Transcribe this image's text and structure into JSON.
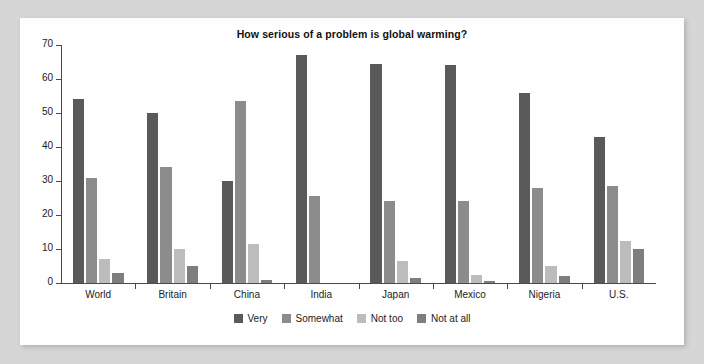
{
  "chart_data": {
    "type": "bar",
    "title": "How serious of a problem is global warming?",
    "xlabel": "",
    "ylabel": "",
    "ylim": [
      0,
      70
    ],
    "yticks": [
      0,
      10,
      20,
      30,
      40,
      50,
      60,
      70
    ],
    "grid": false,
    "legend_position": "bottom",
    "categories": [
      "World",
      "Britain",
      "China",
      "India",
      "Japan",
      "Mexico",
      "Nigeria",
      "U.S."
    ],
    "series": [
      {
        "name": "Very",
        "color": "#5a5a5a",
        "values": [
          54,
          50,
          30,
          67,
          64.5,
          64,
          56,
          43
        ]
      },
      {
        "name": "Somewhat",
        "color": "#8c8c8c",
        "values": [
          31,
          34,
          53.5,
          25.5,
          24,
          24,
          28,
          28.5
        ]
      },
      {
        "name": "Not too",
        "color": "#bcbcbc",
        "values": [
          7,
          10,
          11.5,
          0,
          6.5,
          2.5,
          5,
          12.5
        ]
      },
      {
        "name": "Not at all",
        "color": "#7e7e7e",
        "values": [
          3,
          5,
          1,
          0,
          1.5,
          0.5,
          2,
          10
        ]
      }
    ]
  },
  "colors": {
    "page_background": "#d6d6d6",
    "panel_background": "#fefefe",
    "axis": "#4a4a4a",
    "text": "#1c1c1c"
  }
}
